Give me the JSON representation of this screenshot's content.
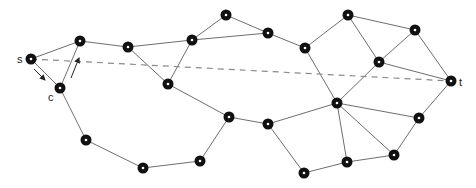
{
  "diagram": {
    "type": "graph",
    "labels": {
      "source": "s",
      "target": "t",
      "cursor": "c"
    },
    "colors": {
      "edge": "#6e6e6e",
      "dashed": "#8a8a8a",
      "node": "#111111",
      "node_center": "#ffffff"
    },
    "nodes": [
      {
        "id": "s",
        "x": 31,
        "y": 59,
        "label": "s"
      },
      {
        "id": "n1",
        "x": 80,
        "y": 41
      },
      {
        "id": "c",
        "x": 60,
        "y": 88
      },
      {
        "id": "n3",
        "x": 128,
        "y": 47
      },
      {
        "id": "n4",
        "x": 192,
        "y": 40
      },
      {
        "id": "n5",
        "x": 226,
        "y": 15
      },
      {
        "id": "n6",
        "x": 268,
        "y": 33
      },
      {
        "id": "n7",
        "x": 305,
        "y": 48
      },
      {
        "id": "n8",
        "x": 168,
        "y": 84
      },
      {
        "id": "n9",
        "x": 229,
        "y": 117
      },
      {
        "id": "n10",
        "x": 268,
        "y": 124
      },
      {
        "id": "n11",
        "x": 86,
        "y": 140
      },
      {
        "id": "n12",
        "x": 143,
        "y": 168
      },
      {
        "id": "n13",
        "x": 200,
        "y": 161
      },
      {
        "id": "n14",
        "x": 304,
        "y": 173
      },
      {
        "id": "n15",
        "x": 337,
        "y": 103
      },
      {
        "id": "n16",
        "x": 348,
        "y": 15
      },
      {
        "id": "n17",
        "x": 379,
        "y": 62
      },
      {
        "id": "n18",
        "x": 415,
        "y": 30
      },
      {
        "id": "t",
        "x": 451,
        "y": 81,
        "label": "t"
      },
      {
        "id": "n20",
        "x": 419,
        "y": 118
      },
      {
        "id": "n21",
        "x": 394,
        "y": 155
      },
      {
        "id": "n22",
        "x": 347,
        "y": 162
      }
    ],
    "edges": [
      [
        "s",
        "n1"
      ],
      [
        "s",
        "c"
      ],
      [
        "c",
        "n1"
      ],
      [
        "n1",
        "n3"
      ],
      [
        "n3",
        "n4"
      ],
      [
        "n4",
        "n5"
      ],
      [
        "n5",
        "n6"
      ],
      [
        "n4",
        "n6"
      ],
      [
        "n6",
        "n7"
      ],
      [
        "n3",
        "n8"
      ],
      [
        "n4",
        "n8"
      ],
      [
        "n8",
        "n9"
      ],
      [
        "n9",
        "n10"
      ],
      [
        "c",
        "n11"
      ],
      [
        "n11",
        "n12"
      ],
      [
        "n12",
        "n13"
      ],
      [
        "n13",
        "n9"
      ],
      [
        "n10",
        "n14"
      ],
      [
        "n10",
        "n15"
      ],
      [
        "n7",
        "n15"
      ],
      [
        "n7",
        "n16"
      ],
      [
        "n16",
        "n17"
      ],
      [
        "n16",
        "n18"
      ],
      [
        "n17",
        "n18"
      ],
      [
        "n17",
        "t"
      ],
      [
        "n18",
        "t"
      ],
      [
        "n15",
        "n17"
      ],
      [
        "n15",
        "n20"
      ],
      [
        "n15",
        "n21"
      ],
      [
        "n15",
        "n22"
      ],
      [
        "n20",
        "t"
      ],
      [
        "n21",
        "n20"
      ],
      [
        "n22",
        "n21"
      ],
      [
        "n14",
        "n22"
      ]
    ],
    "dashed_line": {
      "from": "s",
      "to": "t"
    },
    "arrows": [
      {
        "x1": 34,
        "y1": 69,
        "x2": 45,
        "y2": 80,
        "direction": "down-right"
      },
      {
        "x1": 71,
        "y1": 78,
        "x2": 79,
        "y2": 58,
        "direction": "up-right"
      }
    ],
    "label_positions": {
      "s": {
        "x": 17,
        "y": 63
      },
      "c": {
        "x": 48,
        "y": 101
      },
      "t": {
        "x": 459,
        "y": 86
      }
    }
  }
}
